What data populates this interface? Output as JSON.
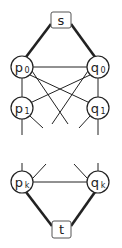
{
  "diagram": {
    "source": {
      "label": "s"
    },
    "sink": {
      "label": "t"
    },
    "left_nodes": [
      {
        "base": "p",
        "sub": "0"
      },
      {
        "base": "p",
        "sub": "1"
      },
      {
        "base": "p",
        "sub": "k"
      }
    ],
    "right_nodes": [
      {
        "base": "q",
        "sub": "0"
      },
      {
        "base": "q",
        "sub": "1"
      },
      {
        "base": "q",
        "sub": "k"
      }
    ],
    "colors": {
      "stroke": "#222222",
      "box_stroke": "#555555",
      "background": "#ffffff"
    }
  }
}
